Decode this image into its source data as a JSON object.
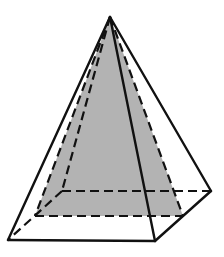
{
  "figure": {
    "type": "square-pyramid",
    "colors": {
      "background": "#ffffff",
      "stroke": "#111111",
      "shade": "#b3b3b3"
    },
    "vertices": {
      "apex": [
        110,
        17
      ],
      "base_front_left": [
        8,
        240
      ],
      "base_front_right": [
        155,
        241
      ],
      "base_back_right": [
        211,
        191
      ],
      "base_back_left": [
        62,
        191
      ],
      "mid_left_edge": [
        35,
        216
      ],
      "mid_right_edge": [
        183,
        216
      ]
    },
    "shaded_cross_section": {
      "description": "triangle from apex to midpoints of left and right base edges",
      "points": [
        [
          110,
          17
        ],
        [
          35,
          216
        ],
        [
          183,
          216
        ]
      ]
    },
    "solid_edges": [
      [
        [
          110,
          17
        ],
        [
          8,
          240
        ]
      ],
      [
        [
          110,
          17
        ],
        [
          155,
          241
        ]
      ],
      [
        [
          110,
          17
        ],
        [
          211,
          191
        ]
      ],
      [
        [
          8,
          240
        ],
        [
          155,
          241
        ]
      ],
      [
        [
          155,
          241
        ],
        [
          211,
          191
        ]
      ]
    ],
    "hidden_edges": [
      [
        [
          110,
          17
        ],
        [
          62,
          191
        ]
      ],
      [
        [
          62,
          191
        ],
        [
          211,
          191
        ]
      ],
      [
        [
          62,
          191
        ],
        [
          8,
          240
        ]
      ],
      [
        [
          110,
          17
        ],
        [
          35,
          216
        ]
      ],
      [
        [
          110,
          17
        ],
        [
          183,
          216
        ]
      ],
      [
        [
          35,
          216
        ],
        [
          183,
          216
        ]
      ]
    ]
  }
}
